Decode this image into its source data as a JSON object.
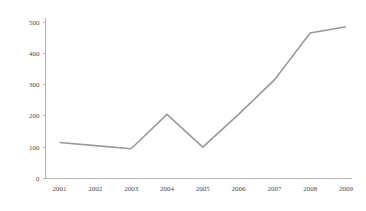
{
  "chart_data": {
    "type": "line",
    "title": "",
    "subtitle": "",
    "xlabel": "",
    "ylabel": "",
    "categories": [
      "2001",
      "2002",
      "2003",
      "2004",
      "2005",
      "2006",
      "2007",
      "2008",
      "2009"
    ],
    "values": [
      115,
      105,
      95,
      205,
      100,
      205,
      315,
      465,
      485
    ],
    "series": [
      {
        "name": "",
        "values": [
          115,
          105,
          95,
          205,
          100,
          205,
          315,
          465,
          485
        ],
        "color": "#9a9a9a"
      }
    ],
    "ylim": [
      0,
      500
    ],
    "y_ticks": [
      0,
      100,
      200,
      300,
      400,
      500
    ],
    "y_tick_labels": [
      "0",
      "100",
      "200",
      "300",
      "400",
      "500"
    ],
    "x_tick_labels": [
      "2001",
      "2002",
      "2003",
      "2004",
      "2005",
      "2006",
      "2007",
      "2008",
      "2009"
    ],
    "grid": false,
    "legend": false,
    "legend_position": "none",
    "markers": false,
    "axis_color": "#b5b5b5",
    "tick_label_color": "#4a4a4a"
  },
  "axes": {
    "y_tick_labels": [
      "500",
      "400",
      "300",
      "200",
      "100",
      "0"
    ],
    "x_tick_labels": [
      "2001",
      "2002",
      "2003",
      "2004",
      "2005",
      "2006",
      "2007",
      "2008",
      "2009"
    ]
  }
}
